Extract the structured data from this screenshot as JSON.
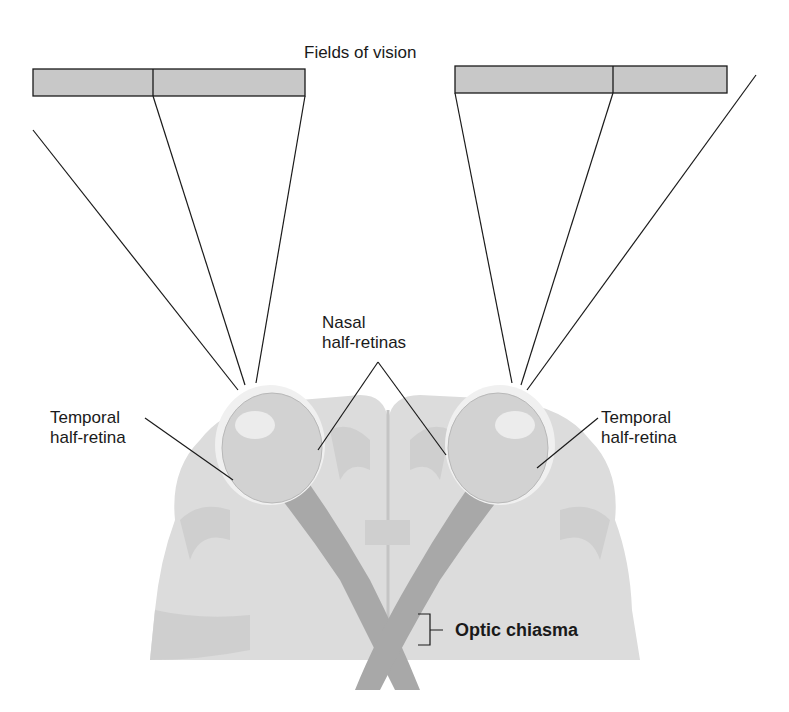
{
  "title": "Fields of vision",
  "labels": {
    "nasal": [
      "Nasal",
      "half-retinas"
    ],
    "temporal_left": [
      "Temporal",
      "half-retina"
    ],
    "temporal_right": [
      "Temporal",
      "half-retina"
    ],
    "optic_chiasma": "Optic chiasma"
  },
  "colors": {
    "field_fill": "#c8c8c8",
    "brain_fill": "#dcdcdc",
    "gyri_fill": "#cfcfcf",
    "nerve_fill": "#a8a8a8",
    "eye_fill": "#d2d2d2",
    "line": "#1a1a1a"
  }
}
